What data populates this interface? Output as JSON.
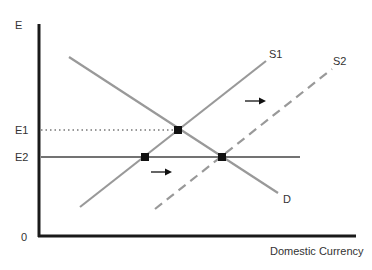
{
  "diagram": {
    "title": "",
    "y_axis_label": "E",
    "x_axis_label": "Domestic Currency",
    "origin_label": "0",
    "level_labels": {
      "e1": "E1",
      "e2": "E2"
    },
    "curves": {
      "demand": {
        "label": "D",
        "color": "#999999",
        "style": "solid"
      },
      "supply1": {
        "label": "S1",
        "color": "#999999",
        "style": "solid"
      },
      "supply2": {
        "label": "S2",
        "color": "#999999",
        "style": "dashed"
      }
    },
    "arrows": [
      {
        "direction": "right",
        "meaning": "supply shifts right"
      },
      {
        "direction": "right",
        "meaning": "supply shifts right"
      }
    ],
    "equilibrium_points": [
      {
        "name": "S1-D at E1"
      },
      {
        "name": "S1 at E2"
      },
      {
        "name": "S2-D at E2"
      }
    ],
    "colors": {
      "axis": "#1a1a1a",
      "curve": "#999999",
      "point": "#111111"
    }
  }
}
